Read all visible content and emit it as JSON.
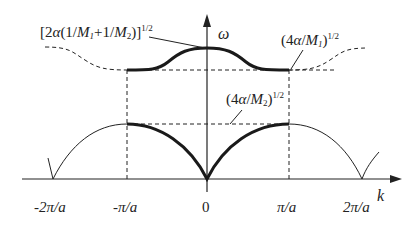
{
  "diagram": {
    "axes": {
      "y_label": "ω",
      "x_label": "k"
    },
    "x_ticks": [
      "-2π/a",
      "-π/a",
      "0",
      "π/a",
      "2π/a"
    ],
    "annotations": {
      "optical_top": "[2α(1/M₁+1/M₂)]^1/2",
      "optical_bottom": "(4α/M₁)^1/2",
      "acoustic_top": "(4α/M₂)^1/2"
    },
    "branches": [
      {
        "name": "optical",
        "style": "thick solid in first Brillouin zone, dashed outside"
      },
      {
        "name": "acoustic",
        "style": "thick solid in first Brillouin zone, thin solid outside"
      }
    ],
    "colors": {
      "line": "#1a1a1a",
      "background": "#ffffff"
    }
  }
}
